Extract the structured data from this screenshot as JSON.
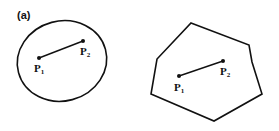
{
  "figure": {
    "panel_label": "(a)",
    "left_shape": {
      "type": "ellipse",
      "points": [
        {
          "name": "P",
          "sub": "1"
        },
        {
          "name": "P",
          "sub": "2"
        }
      ]
    },
    "right_shape": {
      "type": "polygon",
      "points": [
        {
          "name": "P",
          "sub": "1"
        },
        {
          "name": "P",
          "sub": "2"
        }
      ]
    }
  }
}
